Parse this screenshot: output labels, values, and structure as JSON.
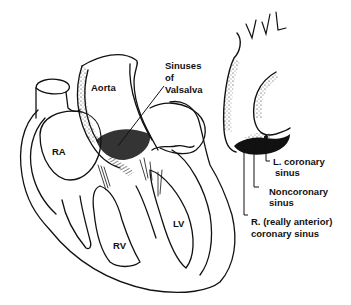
{
  "figure": {
    "stroke_color": "#111111",
    "background": "#ffffff"
  },
  "labels": {
    "aorta": "Aorta",
    "sinuses_line1": "Sinuses",
    "sinuses_line2": "of",
    "sinuses_line3": "Valsalva",
    "ra": "RA",
    "rv": "RV",
    "lv": "LV",
    "l_coronary_line1": "L. coronary",
    "l_coronary_line2": "sinus",
    "noncoronary_line1": "Noncoronary",
    "noncoronary_line2": "sinus",
    "r_coronary_line1": "R. (really anterior)",
    "r_coronary_line2": "coronary sinus",
    "handwriting": "VVL"
  }
}
